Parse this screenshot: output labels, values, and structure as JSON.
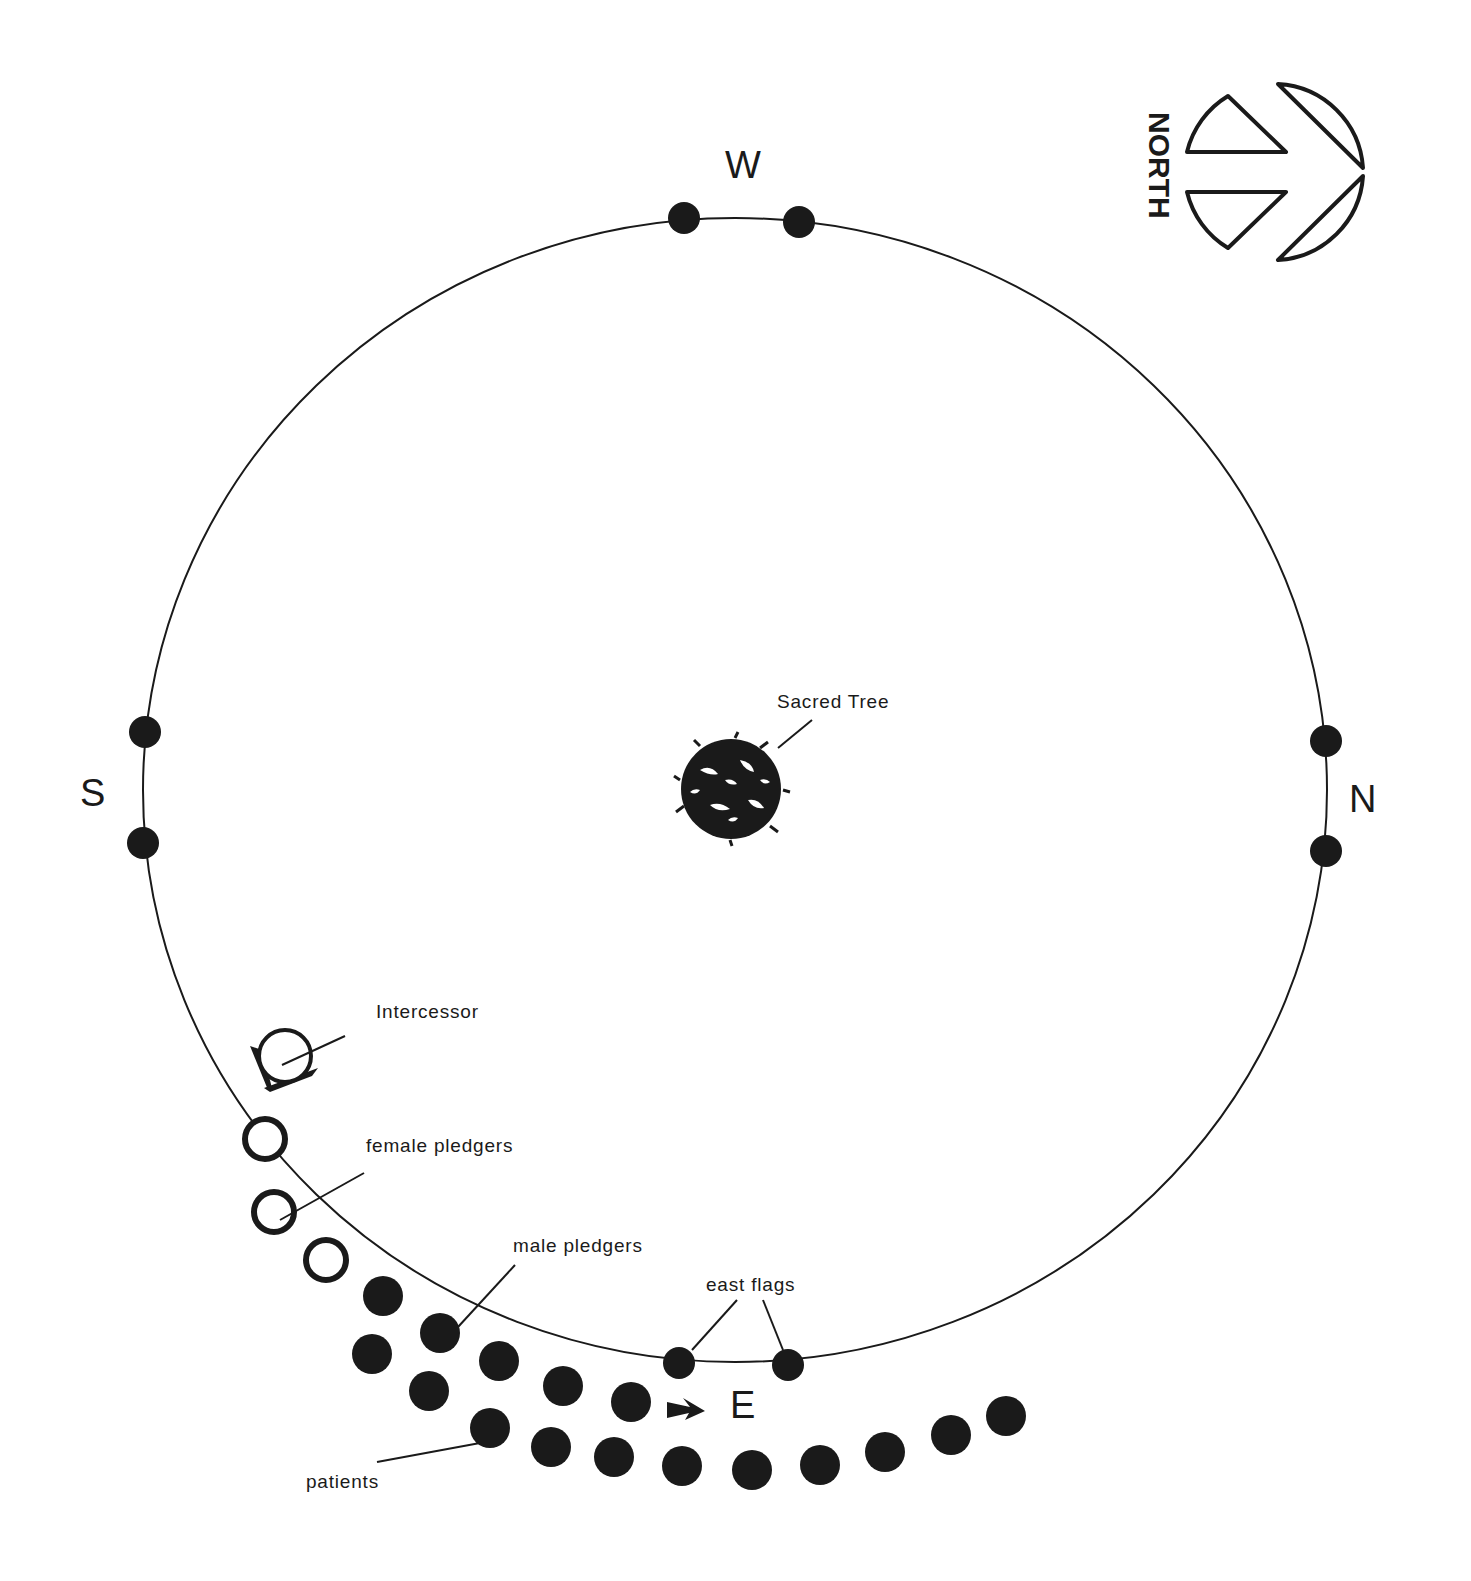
{
  "diagram": {
    "compass": {
      "label": "NORTH"
    },
    "directions": {
      "west": "W",
      "south": "S",
      "north": "N",
      "east": "E"
    },
    "labels": {
      "sacred_tree": "Sacred Tree",
      "intercessor": "Intercessor",
      "female_pledgers": "female pledgers",
      "male_pledgers": "male pledgers",
      "east_flags": "east flags",
      "patients": "patients"
    },
    "colors": {
      "ink": "#1a1a1a",
      "background": "#ffffff"
    },
    "counts": {
      "female_pledgers": 3,
      "male_pledgers": 7,
      "patients": 10,
      "flags": 8
    }
  }
}
